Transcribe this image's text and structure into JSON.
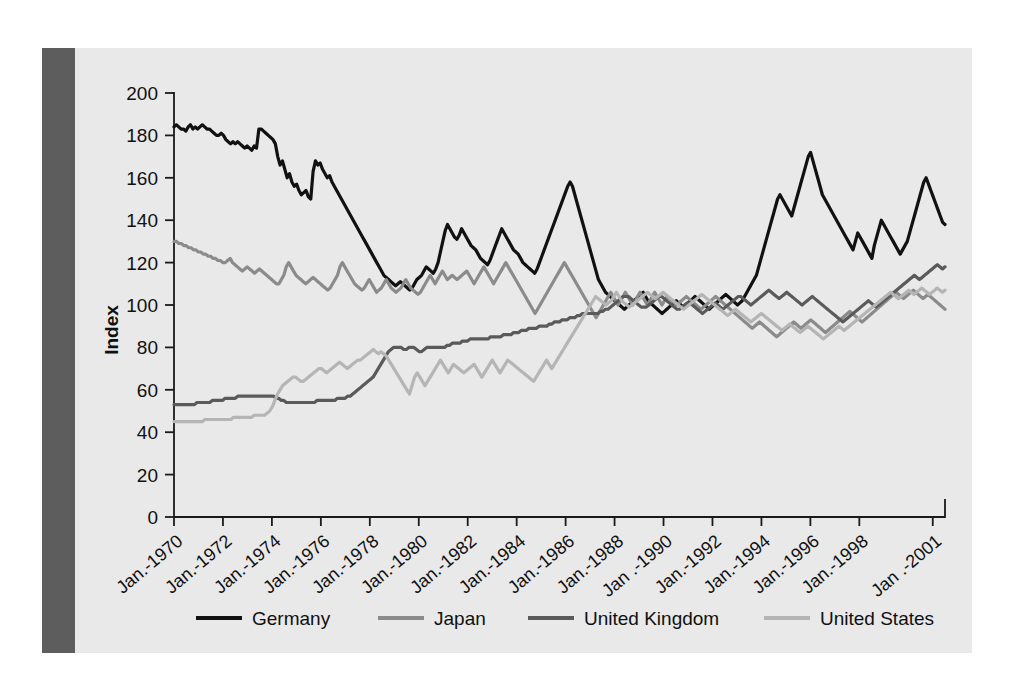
{
  "chart_data": {
    "type": "line",
    "title": "",
    "xlabel": "",
    "ylabel": "Index",
    "ylim": [
      0,
      200
    ],
    "yticks": [
      0,
      20,
      40,
      60,
      80,
      100,
      120,
      140,
      160,
      180,
      200
    ],
    "grid": false,
    "legend_position": "bottom",
    "xtick_labels": [
      "Jan.-1970",
      "Jan.-1972",
      "Jan.-1974",
      "Jan.-1976",
      "Jan.-1978",
      "Jan.-1980",
      "Jan.-1982",
      "Jan.-1984",
      "Jan.-1986",
      "Jan.-1988",
      "Jan .-1990",
      "Jan.-1992",
      "Jan.-1994",
      "Jan.-1996",
      "Jan.-1998",
      "Jan .-2001"
    ],
    "x_start_year": 1970,
    "x_end_year": 2001.5,
    "series": [
      {
        "name": "Germany",
        "color": "#111111",
        "width": 3.2,
        "values": [
          184,
          185,
          184,
          183,
          183,
          182,
          184,
          185,
          183,
          184,
          183,
          184,
          185,
          184,
          183,
          183,
          182,
          181,
          180,
          180,
          181,
          180,
          178,
          177,
          176,
          177,
          176,
          177,
          176,
          175,
          174,
          175,
          174,
          173,
          175,
          174,
          183,
          183,
          182,
          181,
          180,
          179,
          178,
          176,
          170,
          166,
          168,
          164,
          160,
          162,
          158,
          156,
          157,
          154,
          152,
          153,
          154,
          151,
          150,
          163,
          168,
          166,
          167,
          164,
          162,
          160,
          161,
          158,
          156,
          154,
          152,
          150,
          148,
          146,
          144,
          142,
          140,
          138,
          136,
          134,
          132,
          130,
          128,
          126,
          124,
          122,
          120,
          118,
          116,
          114,
          113,
          112,
          111,
          110,
          109,
          110,
          111,
          110,
          109,
          108,
          107,
          108,
          110,
          112,
          113,
          114,
          116,
          118,
          117,
          116,
          115,
          117,
          120,
          125,
          130,
          135,
          138,
          136,
          134,
          132,
          131,
          133,
          136,
          134,
          132,
          130,
          128,
          127,
          126,
          124,
          122,
          121,
          120,
          119,
          121,
          124,
          127,
          130,
          133,
          136,
          134,
          132,
          130,
          128,
          126,
          125,
          124,
          122,
          120,
          119,
          118,
          117,
          116,
          115,
          117,
          120,
          123,
          126,
          129,
          132,
          135,
          138,
          141,
          144,
          147,
          150,
          153,
          156,
          158,
          156,
          152,
          148,
          144,
          140,
          136,
          132,
          128,
          124,
          120,
          116,
          112,
          110,
          108,
          106,
          105,
          104,
          103,
          102,
          101,
          100,
          99,
          98,
          99,
          100,
          101,
          102,
          103,
          104,
          105,
          106,
          104,
          102,
          101,
          100,
          99,
          98,
          97,
          96,
          97,
          98,
          99,
          100,
          101,
          102,
          101,
          100,
          99,
          100,
          101,
          102,
          103,
          104,
          103,
          102,
          101,
          100,
          99,
          98,
          99,
          100,
          101,
          102,
          103,
          104,
          105,
          104,
          103,
          102,
          101,
          100,
          101,
          102,
          104,
          106,
          108,
          110,
          112,
          114,
          118,
          122,
          126,
          130,
          134,
          138,
          142,
          146,
          150,
          152,
          150,
          148,
          146,
          144,
          142,
          146,
          150,
          154,
          158,
          162,
          166,
          170,
          172,
          168,
          164,
          160,
          156,
          152,
          150,
          148,
          146,
          144,
          142,
          140,
          138,
          136,
          134,
          132,
          130,
          128,
          126,
          130,
          134,
          132,
          130,
          128,
          126,
          124,
          122,
          128,
          132,
          136,
          140,
          138,
          136,
          134,
          132,
          130,
          128,
          126,
          124,
          126,
          128,
          130,
          134,
          138,
          142,
          146,
          150,
          154,
          158,
          160,
          157,
          154,
          151,
          148,
          145,
          142,
          139,
          138
        ]
      },
      {
        "name": "Japan",
        "color": "#8b8b8b",
        "width": 3.2,
        "values": [
          130,
          130,
          129,
          129,
          128,
          128,
          127,
          127,
          126,
          126,
          125,
          125,
          124,
          124,
          123,
          123,
          122,
          122,
          121,
          121,
          120,
          120,
          121,
          122,
          120,
          119,
          118,
          117,
          116,
          117,
          118,
          117,
          116,
          115,
          116,
          117,
          116,
          115,
          114,
          113,
          112,
          111,
          110,
          110,
          112,
          114,
          118,
          120,
          118,
          116,
          114,
          113,
          112,
          111,
          110,
          111,
          112,
          113,
          112,
          111,
          110,
          109,
          108,
          107,
          108,
          110,
          112,
          114,
          118,
          120,
          118,
          116,
          114,
          112,
          110,
          109,
          108,
          107,
          108,
          110,
          112,
          110,
          108,
          106,
          107,
          108,
          110,
          112,
          110,
          108,
          107,
          106,
          107,
          108,
          110,
          112,
          110,
          108,
          107,
          106,
          105,
          106,
          108,
          110,
          112,
          114,
          112,
          110,
          112,
          114,
          116,
          114,
          112,
          113,
          114,
          113,
          112,
          113,
          114,
          115,
          116,
          114,
          112,
          110,
          112,
          114,
          116,
          118,
          116,
          114,
          112,
          110,
          112,
          114,
          116,
          118,
          120,
          118,
          116,
          114,
          112,
          110,
          108,
          106,
          104,
          102,
          100,
          98,
          96,
          98,
          100,
          102,
          104,
          106,
          108,
          110,
          112,
          114,
          116,
          118,
          120,
          118,
          116,
          114,
          112,
          110,
          108,
          106,
          104,
          102,
          100,
          98,
          96,
          94,
          96,
          98,
          100,
          102,
          104,
          106,
          104,
          102,
          100,
          102,
          104,
          106,
          104,
          102,
          100,
          102,
          104,
          106,
          104,
          102,
          100,
          102,
          104,
          106,
          104,
          102,
          100,
          102,
          104,
          103,
          102,
          101,
          100,
          101,
          102,
          103,
          104,
          103,
          102,
          101,
          100,
          99,
          98,
          99,
          100,
          101,
          102,
          103,
          104,
          103,
          102,
          101,
          100,
          99,
          98,
          97,
          96,
          95,
          94,
          93,
          92,
          91,
          90,
          89,
          90,
          91,
          92,
          91,
          90,
          89,
          88,
          87,
          86,
          85,
          86,
          87,
          88,
          89,
          90,
          91,
          92,
          91,
          90,
          89,
          90,
          91,
          92,
          93,
          92,
          91,
          90,
          89,
          88,
          87,
          88,
          89,
          90,
          91,
          92,
          93,
          94,
          95,
          96,
          97,
          96,
          95,
          94,
          93,
          92,
          93,
          94,
          95,
          96,
          97,
          98,
          99,
          100,
          101,
          102,
          103,
          104,
          105,
          106,
          105,
          104,
          103,
          104,
          105,
          106,
          107,
          106,
          105,
          104,
          103,
          104,
          105,
          104,
          103,
          102,
          101,
          100,
          99,
          98
        ]
      },
      {
        "name": "United Kingdom",
        "color": "#5a5a5a",
        "width": 3.2,
        "values": [
          53,
          53,
          53,
          53,
          53,
          53,
          53,
          53,
          53,
          54,
          54,
          54,
          54,
          54,
          54,
          55,
          55,
          55,
          55,
          55,
          56,
          56,
          56,
          56,
          56,
          57,
          57,
          57,
          57,
          57,
          57,
          57,
          57,
          57,
          57,
          57,
          57,
          57,
          57,
          57,
          56,
          56,
          55,
          55,
          54,
          54,
          54,
          54,
          54,
          54,
          54,
          54,
          54,
          54,
          54,
          54,
          55,
          55,
          55,
          55,
          55,
          55,
          55,
          55,
          56,
          56,
          56,
          56,
          57,
          57,
          58,
          59,
          60,
          61,
          62,
          63,
          64,
          65,
          66,
          68,
          70,
          72,
          74,
          76,
          78,
          79,
          80,
          80,
          80,
          80,
          79,
          79,
          80,
          80,
          80,
          79,
          78,
          78,
          79,
          80,
          80,
          80,
          80,
          80,
          80,
          80,
          80,
          81,
          81,
          82,
          82,
          82,
          82,
          83,
          83,
          83,
          84,
          84,
          84,
          84,
          84,
          84,
          84,
          84,
          85,
          85,
          85,
          85,
          85,
          86,
          86,
          86,
          86,
          87,
          87,
          87,
          88,
          88,
          88,
          89,
          89,
          89,
          89,
          90,
          90,
          90,
          90,
          91,
          91,
          92,
          92,
          92,
          93,
          93,
          93,
          94,
          94,
          94,
          95,
          95,
          96,
          96,
          96,
          96,
          96,
          96,
          96,
          97,
          97,
          98,
          98,
          99,
          100,
          101,
          102,
          103,
          104,
          104,
          104,
          103,
          102,
          101,
          100,
          99,
          99,
          99,
          100,
          101,
          102,
          103,
          104,
          104,
          103,
          102,
          101,
          100,
          99,
          98,
          98,
          99,
          100,
          101,
          101,
          100,
          99,
          98,
          97,
          96,
          97,
          98,
          99,
          100,
          101,
          100,
          99,
          98,
          99,
          100,
          101,
          102,
          103,
          104,
          104,
          103,
          102,
          101,
          100,
          101,
          102,
          103,
          104,
          105,
          106,
          107,
          106,
          105,
          104,
          103,
          104,
          105,
          106,
          105,
          104,
          103,
          102,
          101,
          100,
          101,
          102,
          103,
          104,
          103,
          102,
          101,
          100,
          99,
          98,
          97,
          96,
          95,
          94,
          93,
          92,
          93,
          94,
          95,
          96,
          97,
          98,
          99,
          100,
          101,
          102,
          101,
          100,
          99,
          100,
          101,
          102,
          103,
          104,
          105,
          106,
          107,
          108,
          109,
          110,
          111,
          112,
          113,
          114,
          113,
          112,
          113,
          114,
          115,
          116,
          117,
          118,
          119,
          118,
          117,
          118
        ]
      },
      {
        "name": "United States",
        "color": "#b5b5b5",
        "width": 3.2,
        "values": [
          45,
          45,
          45,
          45,
          45,
          45,
          45,
          45,
          45,
          45,
          45,
          45,
          46,
          46,
          46,
          46,
          46,
          46,
          46,
          46,
          46,
          46,
          46,
          47,
          47,
          47,
          47,
          47,
          47,
          47,
          47,
          48,
          48,
          48,
          48,
          48,
          49,
          50,
          52,
          55,
          58,
          60,
          62,
          63,
          64,
          65,
          66,
          66,
          65,
          64,
          64,
          65,
          66,
          67,
          68,
          69,
          70,
          70,
          69,
          68,
          69,
          70,
          71,
          72,
          73,
          72,
          71,
          70,
          71,
          72,
          73,
          74,
          74,
          75,
          76,
          77,
          78,
          79,
          78,
          77,
          78,
          77,
          76,
          74,
          72,
          70,
          68,
          66,
          64,
          62,
          60,
          58,
          62,
          66,
          68,
          66,
          64,
          62,
          64,
          66,
          68,
          70,
          72,
          74,
          72,
          70,
          68,
          70,
          72,
          71,
          70,
          69,
          68,
          69,
          70,
          71,
          72,
          70,
          68,
          66,
          68,
          70,
          72,
          74,
          72,
          70,
          68,
          70,
          72,
          74,
          73,
          72,
          71,
          70,
          69,
          68,
          67,
          66,
          65,
          64,
          66,
          68,
          70,
          72,
          74,
          72,
          70,
          72,
          74,
          76,
          78,
          80,
          82,
          84,
          86,
          88,
          90,
          92,
          94,
          96,
          98,
          100,
          102,
          104,
          103,
          102,
          101,
          100,
          101,
          102,
          104,
          106,
          104,
          102,
          101,
          100,
          99,
          100,
          101,
          102,
          103,
          104,
          105,
          106,
          105,
          104,
          103,
          104,
          105,
          106,
          105,
          104,
          103,
          102,
          101,
          100,
          99,
          98,
          99,
          100,
          101,
          102,
          103,
          104,
          105,
          104,
          103,
          102,
          101,
          100,
          99,
          98,
          97,
          96,
          95,
          96,
          97,
          98,
          97,
          96,
          95,
          94,
          93,
          92,
          93,
          94,
          95,
          96,
          95,
          94,
          93,
          92,
          91,
          90,
          89,
          88,
          89,
          90,
          91,
          90,
          89,
          88,
          87,
          88,
          89,
          90,
          89,
          88,
          87,
          86,
          85,
          84,
          85,
          86,
          87,
          88,
          89,
          90,
          89,
          88,
          89,
          90,
          91,
          92,
          93,
          94,
          95,
          96,
          97,
          98,
          99,
          100,
          101,
          102,
          103,
          104,
          105,
          106,
          105,
          104,
          103,
          104,
          105,
          106,
          107,
          106,
          105,
          106,
          107,
          108,
          107,
          106,
          105,
          106,
          107,
          108,
          107,
          106,
          107
        ]
      }
    ]
  },
  "legend": {
    "items": [
      {
        "label": "Germany"
      },
      {
        "label": "Japan"
      },
      {
        "label": "United Kingdom"
      },
      {
        "label": "United States"
      }
    ]
  }
}
